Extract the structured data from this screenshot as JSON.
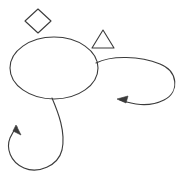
{
  "canvas": {
    "width": 188,
    "height": 178,
    "background_color": "#ffffff",
    "stroke_color": "#3b3b3b",
    "stroke_width": 1.1,
    "description": "Hand-drawn style line sketch: a large ellipse with two curved loop arrows and two small outline shapes above it"
  },
  "shapes": {
    "diamond": {
      "name": "diamond",
      "label": "",
      "center_x": 38,
      "center_y": 21,
      "half_width": 13,
      "half_height": 12,
      "points": "38,9 51,21 38,33 25,21",
      "filled": false
    },
    "triangle": {
      "name": "triangle",
      "label": "",
      "apex_x": 103,
      "apex_y": 30,
      "left_x": 92,
      "left_y": 48,
      "right_x": 114,
      "right_y": 48,
      "points": "103,30 114,48 92,48",
      "filled": false
    },
    "ellipse": {
      "name": "ellipse",
      "label": "",
      "center_x": 54,
      "center_y": 68,
      "radius_x": 44,
      "radius_y": 31,
      "filled": false
    }
  },
  "arrows": {
    "right_loop": {
      "name": "right-loop-arrow",
      "label": "",
      "path": "M 96 63 C 112 55 140 56 160 64 C 178 71 180 92 164 100 C 148 108 132 104 120 100",
      "head_tip_x": 117,
      "head_tip_y": 99,
      "head_points": "117,99 128,96 126,103",
      "direction": "counterclockwise-left",
      "extent_right_x": 178,
      "extent_bottom_y": 106
    },
    "bottom_loop": {
      "name": "bottom-loop-arrow",
      "label": "",
      "path": "M 52 98 C 58 112 66 132 62 150 C 58 166 38 174 24 168 C 10 162 6 148 10 138 C 13 131 15 129 17 127",
      "head_tip_x": 16,
      "head_tip_y": 125,
      "head_points": "16,125 21,135 13,131",
      "direction": "counterclockwise-up",
      "extent_left_x": 7,
      "extent_bottom_y": 171
    }
  }
}
